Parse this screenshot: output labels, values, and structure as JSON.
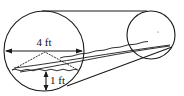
{
  "figure": {
    "labels": {
      "diameter": "4 ft",
      "depth": "1 ft"
    },
    "colors": {
      "line": "#1a1a1a",
      "background": "#ffffff"
    }
  }
}
